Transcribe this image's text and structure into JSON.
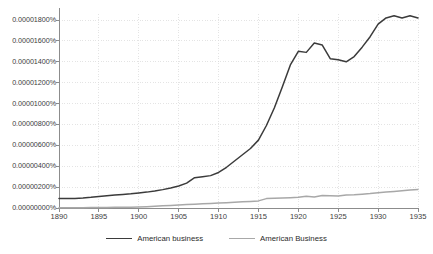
{
  "chart_data": {
    "type": "line",
    "title": "",
    "xlabel": "",
    "ylabel": "",
    "xlim": [
      1890,
      1935
    ],
    "ylim": [
      0.0,
      1.8e-05
    ],
    "grid": true,
    "legend_position": "bottom",
    "x_tick_labels": [
      "1890",
      "1895",
      "1900",
      "1905",
      "1910",
      "1915",
      "1920",
      "1925",
      "1930",
      "1935"
    ],
    "x_ticks": [
      1890,
      1895,
      1900,
      1905,
      1910,
      1915,
      1920,
      1925,
      1930,
      1935
    ],
    "y_tick_labels": [
      "0.00000000%",
      "0.00000200%",
      "0.00000400%",
      "0.00000600%",
      "0.00000800%",
      "0.00001000%",
      "0.00001200%",
      "0.00001400%",
      "0.00001600%",
      "0.00001800%"
    ],
    "y_ticks": [
      0.0,
      2e-06,
      4e-06,
      6e-06,
      8e-06,
      1e-05,
      1.2e-05,
      1.4e-05,
      1.6e-05,
      1.8e-05
    ],
    "x": [
      1890,
      1891,
      1892,
      1893,
      1894,
      1895,
      1896,
      1897,
      1898,
      1899,
      1900,
      1901,
      1902,
      1903,
      1904,
      1905,
      1906,
      1907,
      1908,
      1909,
      1910,
      1911,
      1912,
      1913,
      1914,
      1915,
      1916,
      1917,
      1918,
      1919,
      1920,
      1921,
      1922,
      1923,
      1924,
      1925,
      1926,
      1927,
      1928,
      1929,
      1930,
      1931,
      1932,
      1933,
      1934,
      1935
    ],
    "series": [
      {
        "name": "American business",
        "color": "#3b3b3b",
        "width": 1.5,
        "values": [
          9e-07,
          9e-07,
          9.2e-07,
          9.6e-07,
          1.02e-06,
          1.1e-06,
          1.18e-06,
          1.24e-06,
          1.3e-06,
          1.36e-06,
          1.44e-06,
          1.52e-06,
          1.62e-06,
          1.76e-06,
          1.92e-06,
          2.1e-06,
          2.38e-06,
          2.9e-06,
          3e-06,
          3.1e-06,
          3.4e-06,
          3.9e-06,
          4.5e-06,
          5.1e-06,
          5.7e-06,
          6.5e-06,
          7.9e-06,
          9.6e-06,
          1.16e-05,
          1.37e-05,
          1.5e-05,
          1.49e-05,
          1.58e-05,
          1.56e-05,
          1.43e-05,
          1.42e-05,
          1.4e-05,
          1.45e-05,
          1.54e-05,
          1.64e-05,
          1.76e-05,
          1.82e-05,
          1.84e-05,
          1.82e-05,
          1.84e-05,
          1.82e-05
        ]
      },
      {
        "name": "American Business",
        "color": "#a8a8a8",
        "width": 1.5,
        "values": [
          2e-08,
          2e-08,
          3e-08,
          3e-08,
          4e-08,
          4e-08,
          5e-08,
          6e-08,
          7e-08,
          8e-08,
          1e-07,
          1.3e-07,
          1.7e-07,
          2.1e-07,
          2.5e-07,
          2.9e-07,
          3.3e-07,
          3.7e-07,
          4e-07,
          4.3e-07,
          4.7e-07,
          5.1e-07,
          5.5e-07,
          5.9e-07,
          6.3e-07,
          6.8e-07,
          9e-07,
          9.3e-07,
          9.6e-07,
          9.9e-07,
          1.02e-06,
          1.12e-06,
          1.06e-06,
          1.2e-06,
          1.18e-06,
          1.16e-06,
          1.24e-06,
          1.26e-06,
          1.32e-06,
          1.38e-06,
          1.46e-06,
          1.52e-06,
          1.58e-06,
          1.65e-06,
          1.72e-06,
          1.78e-06
        ]
      }
    ],
    "style": {
      "grid_color": "#d9d9d9",
      "axis_color": "#8c8c8c",
      "text_color": "#3d3d3d",
      "background": "#ffffff"
    }
  }
}
